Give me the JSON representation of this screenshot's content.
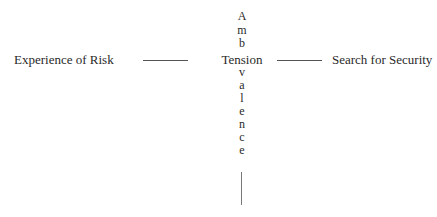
{
  "diagram": {
    "left_node": "Experience of Risk",
    "center_node": "Tension",
    "right_node": "Search for Security",
    "vertical_word": "Ambivalence",
    "vertical_letters_above": [
      "A",
      "m",
      "b"
    ],
    "vertical_letters_below": [
      "v",
      "a",
      "l",
      "e",
      "n",
      "c",
      "e"
    ],
    "connectors": [
      {
        "from": "Experience of Risk",
        "to": "Tension",
        "type": "line"
      },
      {
        "from": "Tension",
        "to": "Search for Security",
        "type": "line"
      },
      {
        "from": "Ambivalence",
        "to": "below",
        "type": "vertical-line"
      }
    ],
    "colors": {
      "text": "#2a2a2a",
      "line": "#555555",
      "background": "#ffffff"
    }
  }
}
